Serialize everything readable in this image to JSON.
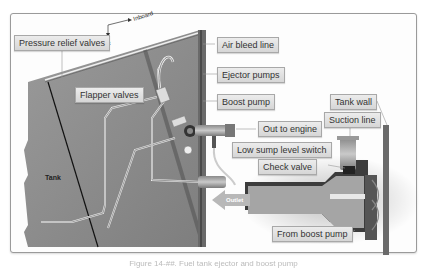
{
  "diagram": {
    "orientation": {
      "inboard": "Inboard",
      "aft": "Aft"
    },
    "tank_label": "Tank",
    "outlet_label": "Outlet",
    "labels": {
      "pressure_relief_valves": "Pressure relief valves",
      "flapper_valves": "Flapper valves",
      "air_bleed_line": "Air bleed line",
      "ejector_pumps": "Ejector pumps",
      "boost_pump": "Boost pump",
      "out_to_engine": "Out to engine",
      "low_sump_level_switch": "Low sump level switch",
      "check_valve": "Check valve",
      "tank_wall": "Tank wall",
      "suction_line": "Suction line",
      "from_boost_pump": "From boost pump"
    },
    "colors": {
      "tank_fill": "#8c8c8c",
      "label_bg": "#dedede",
      "pipe": "#e8e8e8",
      "frame_border": "#9a9a9a"
    }
  },
  "caption": "Figure 14-##. Fuel tank ejector and boost pump"
}
